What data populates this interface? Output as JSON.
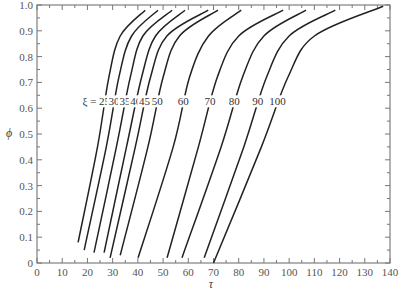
{
  "chart_data": {
    "type": "line",
    "title": "",
    "xlabel": "τ",
    "ylabel": "ϕ",
    "xlim": [
      0,
      140
    ],
    "ylim": [
      0,
      1.0
    ],
    "grid": false,
    "legend_position": "inline-labels",
    "x_ticks": [
      0,
      10,
      20,
      30,
      40,
      50,
      60,
      70,
      80,
      90,
      100,
      110,
      120,
      130,
      140
    ],
    "y_ticks": [
      0,
      0.1,
      0.2,
      0.3,
      0.4,
      0.5,
      0.6,
      0.7,
      0.8,
      0.9,
      1.0
    ],
    "y_tick_labels": [
      "0",
      "0.1",
      "0.2",
      "0.3",
      "0.4",
      "0.5",
      "0.6",
      "0.7",
      "0.8",
      "0.9",
      "1.0"
    ],
    "annotation_prefix": "ξ = ",
    "label_phi": 0.615,
    "series": [
      {
        "name": "25",
        "label": "25",
        "points": [
          [
            16.3,
            0.08
          ],
          [
            24.0,
            0.45
          ],
          [
            28.5,
            0.72
          ],
          [
            33.0,
            0.88
          ],
          [
            42.9,
            0.98
          ]
        ]
      },
      {
        "name": "30",
        "label": "30",
        "points": [
          [
            18.7,
            0.05
          ],
          [
            27.5,
            0.45
          ],
          [
            32.5,
            0.72
          ],
          [
            37.5,
            0.88
          ],
          [
            48.0,
            0.98
          ]
        ]
      },
      {
        "name": "35",
        "label": "35",
        "points": [
          [
            22.6,
            0.04
          ],
          [
            31.5,
            0.45
          ],
          [
            37.0,
            0.72
          ],
          [
            42.0,
            0.88
          ],
          [
            53.6,
            0.98
          ]
        ]
      },
      {
        "name": "40",
        "label": "40",
        "points": [
          [
            26.6,
            0.04
          ],
          [
            35.5,
            0.45
          ],
          [
            41.5,
            0.72
          ],
          [
            47.0,
            0.88
          ],
          [
            58.7,
            0.98
          ]
        ]
      },
      {
        "name": "45",
        "label": "45",
        "points": [
          [
            29.0,
            0.02
          ],
          [
            39.0,
            0.45
          ],
          [
            45.0,
            0.72
          ],
          [
            51.5,
            0.88
          ],
          [
            67.9,
            0.98
          ]
        ]
      },
      {
        "name": "50",
        "label": "50",
        "points": [
          [
            33.0,
            0.03
          ],
          [
            44.0,
            0.45
          ],
          [
            50.0,
            0.72
          ],
          [
            56.5,
            0.88
          ],
          [
            71.8,
            0.98
          ]
        ]
      },
      {
        "name": "60",
        "label": "60",
        "points": [
          [
            40.1,
            0.02
          ],
          [
            54.0,
            0.45
          ],
          [
            60.5,
            0.72
          ],
          [
            68.0,
            0.88
          ],
          [
            81.0,
            0.98
          ]
        ]
      },
      {
        "name": "70",
        "label": "70",
        "points": [
          [
            51.6,
            0.02
          ],
          [
            64.0,
            0.45
          ],
          [
            71.5,
            0.72
          ],
          [
            80.0,
            0.88
          ],
          [
            97.6,
            0.98
          ]
        ]
      },
      {
        "name": "80",
        "label": "80",
        "points": [
          [
            57.5,
            0.02
          ],
          [
            73.0,
            0.45
          ],
          [
            81.5,
            0.72
          ],
          [
            90.0,
            0.88
          ],
          [
            106.7,
            0.98
          ]
        ]
      },
      {
        "name": "90",
        "label": "90",
        "points": [
          [
            66.3,
            0.02
          ],
          [
            82.0,
            0.45
          ],
          [
            91.0,
            0.72
          ],
          [
            100.0,
            0.88
          ],
          [
            118.3,
            0.98
          ]
        ]
      },
      {
        "name": "100",
        "label": "100",
        "points": [
          [
            70.0,
            0.0
          ],
          [
            89.0,
            0.45
          ],
          [
            99.5,
            0.72
          ],
          [
            110.0,
            0.88
          ],
          [
            137.3,
            0.995
          ]
        ]
      }
    ]
  }
}
